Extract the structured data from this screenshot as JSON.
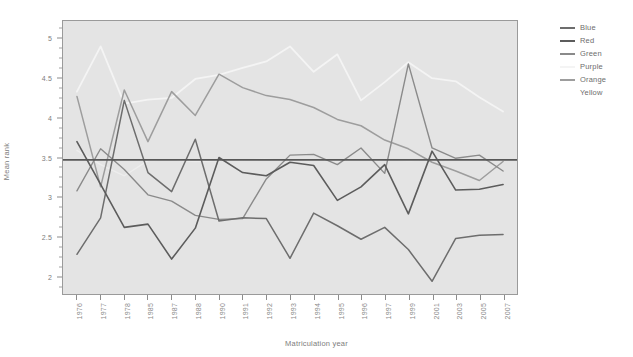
{
  "chart_data": {
    "type": "line",
    "title": "",
    "xlabel": "Matriculation year",
    "ylabel": "Mean rank",
    "categories": [
      "1976",
      "1977",
      "1978",
      "1985",
      "1987",
      "1988",
      "1990",
      "1991",
      "1992",
      "1993",
      "1994",
      "1995",
      "1996",
      "1997",
      "1999",
      "2001",
      "2003",
      "2005",
      "2007"
    ],
    "ylim": [
      1.78,
      5.22
    ],
    "yticks": [
      2,
      2.5,
      3,
      3.5,
      4,
      4.5,
      5
    ],
    "ytick_labels": [
      "2",
      "2.5",
      "3",
      "3.5",
      "4",
      "4.5",
      "5"
    ],
    "yticks_minor": [
      1.875,
      2.125,
      2.25,
      2.375,
      2.625,
      2.75,
      2.875,
      3.125,
      3.25,
      3.375,
      3.625,
      3.75,
      3.875,
      4.125,
      4.25,
      4.375,
      4.625,
      4.75,
      4.875,
      5.125
    ],
    "grid": false,
    "legend_position": "right",
    "reference_line": {
      "name": "overall-mean",
      "value": 3.47,
      "color": "#575757",
      "width": 1.6
    },
    "series": [
      {
        "name": "Blue",
        "color": "#6d6d6d",
        "width": 1.5,
        "values": [
          2.28,
          2.74,
          4.22,
          3.31,
          3.07,
          3.73,
          2.7,
          2.74,
          2.73,
          2.23,
          2.8,
          2.64,
          2.47,
          2.62,
          2.34,
          1.94,
          2.48,
          2.52,
          2.53
        ]
      },
      {
        "name": "Red",
        "color": "#5c5c5c",
        "width": 1.6,
        "values": [
          3.7,
          3.16,
          2.62,
          2.66,
          2.22,
          2.61,
          3.5,
          3.31,
          3.27,
          3.44,
          3.4,
          2.96,
          3.13,
          3.41,
          2.79,
          3.58,
          3.09,
          3.1,
          3.16
        ]
      },
      {
        "name": "Green",
        "color": "#8a8a8a",
        "width": 1.4,
        "values": [
          3.08,
          3.61,
          3.35,
          3.03,
          2.95,
          2.77,
          2.72,
          2.73,
          3.23,
          3.53,
          3.54,
          3.41,
          3.62,
          3.3,
          4.68,
          3.62,
          3.49,
          3.53,
          3.33
        ]
      },
      {
        "name": "Purple",
        "color": "#f4f4f4",
        "width": 1.8,
        "values": [
          4.33,
          4.9,
          4.18,
          4.23,
          4.25,
          4.49,
          4.54,
          4.63,
          4.71,
          4.9,
          4.58,
          4.8,
          4.22,
          4.45,
          4.7,
          4.5,
          4.46,
          4.26,
          4.08
        ]
      },
      {
        "name": "Orange",
        "color": "#9d9d9d",
        "width": 1.5,
        "values": [
          4.27,
          3.13,
          4.35,
          3.7,
          4.33,
          4.03,
          4.55,
          4.38,
          4.28,
          4.23,
          4.13,
          3.98,
          3.9,
          3.72,
          3.61,
          3.44,
          3.33,
          3.21,
          3.45
        ]
      },
      {
        "name": "Yellow",
        "color": "#ededed",
        "width": 1.4,
        "values": [
          3.59,
          3.41,
          3.27,
          3.46,
          3.47,
          3.45,
          3.46,
          3.47,
          3.48,
          3.46,
          3.47,
          3.46,
          3.47,
          3.47,
          3.46,
          3.47,
          3.47,
          3.47,
          3.47
        ]
      }
    ]
  },
  "legend": {
    "items": [
      {
        "label": "Blue"
      },
      {
        "label": "Red"
      },
      {
        "label": "Green"
      },
      {
        "label": "Purple"
      },
      {
        "label": "Orange"
      },
      {
        "label": "Yellow"
      }
    ]
  }
}
